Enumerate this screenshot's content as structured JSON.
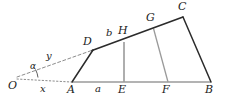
{
  "figure": {
    "width": 232,
    "height": 102,
    "background": "#ffffff",
    "stroke_dark": "#2b2b2b",
    "stroke_gray": "#8c8c8c",
    "stroke_dashed": "#8c8c8c"
  },
  "points": [
    {
      "id": "O",
      "label": "O",
      "x": 14,
      "y": 78,
      "lx": 8,
      "ly": 82
    },
    {
      "id": "A",
      "label": "A",
      "x": 72,
      "y": 82,
      "lx": 68,
      "ly": 86
    },
    {
      "id": "E",
      "label": "E",
      "x": 124,
      "y": 82,
      "lx": 119,
      "ly": 86
    },
    {
      "id": "F",
      "label": "F",
      "x": 168,
      "y": 82,
      "lx": 163,
      "ly": 86
    },
    {
      "id": "B",
      "label": "B",
      "x": 211,
      "y": 82,
      "lx": 206,
      "ly": 86
    },
    {
      "id": "D",
      "label": "D",
      "x": 93,
      "y": 50,
      "lx": 84,
      "ly": 40
    },
    {
      "id": "H",
      "label": "H",
      "x": 124,
      "y": 42,
      "lx": 120,
      "ly": 30
    },
    {
      "id": "G",
      "label": "G",
      "x": 153,
      "y": 28,
      "lx": 147,
      "ly": 16
    },
    {
      "id": "C",
      "label": "C",
      "x": 183,
      "y": 17,
      "lx": 179,
      "ly": 4
    }
  ],
  "segment_labels": [
    {
      "id": "x",
      "label": "x",
      "lx": 41,
      "ly": 85,
      "of": "O-A baseline"
    },
    {
      "id": "a",
      "label": "a",
      "lx": 96,
      "ly": 86,
      "of": "A-E baseline"
    },
    {
      "id": "y",
      "label": "y",
      "lx": 47,
      "ly": 55,
      "of": "O-D ray"
    },
    {
      "id": "b",
      "label": "b",
      "lx": 107,
      "ly": 32,
      "of": "D-H upper edge"
    }
  ],
  "angle_labels": [
    {
      "id": "alpha",
      "label": "α",
      "lx": 30,
      "ly": 64,
      "at": "O"
    }
  ],
  "edges": [
    {
      "id": "baseline-A-B",
      "from": "A",
      "to": "B",
      "style": "solid",
      "color": "gray"
    },
    {
      "id": "upper-D-C",
      "from": "D",
      "to": "C",
      "style": "solid",
      "color": "dark"
    },
    {
      "id": "side-A-D",
      "from": "A",
      "to": "D",
      "style": "solid",
      "color": "dark"
    },
    {
      "id": "side-B-C",
      "from": "B",
      "to": "C",
      "style": "solid",
      "color": "dark"
    },
    {
      "id": "vertical-E-H",
      "from": "E",
      "to": "H",
      "style": "solid",
      "color": "gray"
    },
    {
      "id": "slant-F-G",
      "from": "F",
      "to": "G",
      "style": "solid",
      "color": "gray"
    },
    {
      "id": "ray-O-D",
      "from": "O",
      "to": "D",
      "style": "dashed",
      "color": "dashed"
    },
    {
      "id": "ray-O-A",
      "from": "O",
      "to": "A",
      "style": "dotted",
      "color": "dashed"
    }
  ]
}
